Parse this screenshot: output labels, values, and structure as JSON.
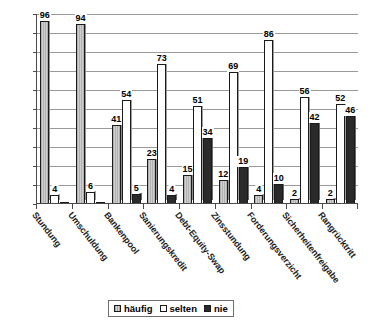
{
  "chart_data": {
    "type": "bar",
    "title": "",
    "xlabel": "",
    "ylabel": "",
    "ylim": [
      0,
      100
    ],
    "grid": true,
    "legend_position": "bottom",
    "categories": [
      "Stundung",
      "Umschuldung",
      "Bankenpool",
      "Sanierungskredit",
      "Debt-Equity-Swap",
      "Zinsstundung",
      "Forderungsverzicht",
      "Sicherheitenfreigabe",
      "Rangrücktritt"
    ],
    "ytick_labels": [
      "100%",
      "90%",
      "80%",
      "70%",
      "60%",
      "50%",
      "40%",
      "30%",
      "20%",
      "10%",
      "0%"
    ],
    "ytick_values": [
      100,
      90,
      80,
      70,
      60,
      50,
      40,
      30,
      20,
      10,
      0
    ],
    "series": [
      {
        "name": "häufig",
        "color": "#b9b9b9",
        "values": [
          96,
          41,
          5,
          4,
          34,
          19,
          10,
          42,
          46
        ]
      },
      {
        "name": "selten",
        "color": "#ffffff",
        "values": [
          4,
          54,
          23,
          15,
          51,
          69,
          86,
          56,
          52
        ]
      },
      {
        "name": "nie",
        "color": "#2a2a2a",
        "values": [
          0,
          6,
          73,
          73,
          12,
          4,
          2,
          2,
          46
        ]
      }
    ],
    "groups": [
      {
        "category": "Stundung",
        "bars": [
          {
            "series": "häufig",
            "value": 96
          },
          {
            "series": "selten",
            "value": 4
          },
          {
            "series": "nie",
            "value": 0
          }
        ]
      },
      {
        "category": "Umschuldung",
        "bars": [
          {
            "series": "häufig",
            "value": 94
          },
          {
            "series": "selten",
            "value": 6
          },
          {
            "series": "nie",
            "value": 0
          }
        ]
      },
      {
        "category": "Bankenpool",
        "bars": [
          {
            "series": "häufig",
            "value": 41
          },
          {
            "series": "selten",
            "value": 54
          },
          {
            "series": "nie",
            "value": 5
          }
        ]
      },
      {
        "category": "Sanierungskredit",
        "bars": [
          {
            "series": "häufig",
            "value": 23
          },
          {
            "series": "selten",
            "value": 73
          },
          {
            "series": "nie",
            "value": 4
          }
        ]
      },
      {
        "category": "Debt-Equity-Swap",
        "bars": [
          {
            "series": "häufig",
            "value": 15
          },
          {
            "series": "selten",
            "value": 51
          },
          {
            "series": "nie",
            "value": 34
          }
        ]
      },
      {
        "category": "Zinsstundung",
        "bars": [
          {
            "series": "häufig",
            "value": 12
          },
          {
            "series": "selten",
            "value": 69
          },
          {
            "series": "nie",
            "value": 19
          }
        ]
      },
      {
        "category": "Forderungsverzicht",
        "bars": [
          {
            "series": "häufig",
            "value": 4
          },
          {
            "series": "selten",
            "value": 86
          },
          {
            "series": "nie",
            "value": 10
          }
        ]
      },
      {
        "category": "Sicherheitenfreigabe",
        "bars": [
          {
            "series": "häufig",
            "value": 2
          },
          {
            "series": "selten",
            "value": 56
          },
          {
            "series": "nie",
            "value": 42
          }
        ]
      },
      {
        "category": "Rangrücktritt",
        "bars": [
          {
            "series": "häufig",
            "value": 2
          },
          {
            "series": "selten",
            "value": 52
          },
          {
            "series": "nie",
            "value": 46
          }
        ]
      }
    ]
  },
  "legend": {
    "items": [
      {
        "label": "häufig",
        "key": "haeufig"
      },
      {
        "label": "selten",
        "key": "selten"
      },
      {
        "label": "nie",
        "key": "nie"
      }
    ]
  }
}
